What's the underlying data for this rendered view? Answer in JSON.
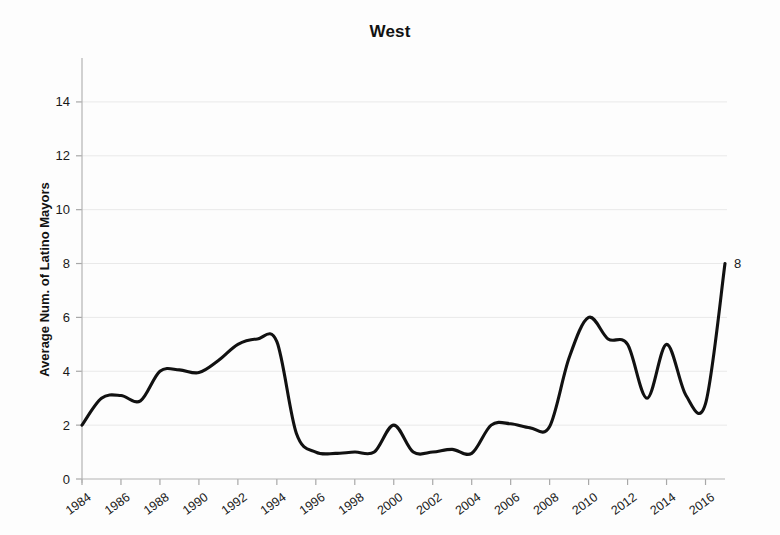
{
  "chart_data": {
    "type": "line",
    "title": "West",
    "xlabel": "",
    "ylabel": "Average Num. of Latino Mayors",
    "xlim": [
      1984,
      2017
    ],
    "ylim": [
      0,
      15
    ],
    "grid": true,
    "legend": "none",
    "line_color": "#111111",
    "background_color": "#fdfdfd",
    "y_ticks": [
      0,
      2,
      4,
      6,
      8,
      10,
      12,
      14
    ],
    "x_ticks": [
      1984,
      1986,
      1988,
      1990,
      1992,
      1994,
      1996,
      1998,
      2000,
      2002,
      2004,
      2006,
      2008,
      2010,
      2012,
      2014,
      2016
    ],
    "x": [
      1984,
      1985,
      1986,
      1987,
      1988,
      1989,
      1990,
      1991,
      1992,
      1993,
      1994,
      1995,
      1996,
      1997,
      1998,
      1999,
      2000,
      2001,
      2002,
      2003,
      2004,
      2005,
      2006,
      2007,
      2008,
      2009,
      2010,
      2011,
      2012,
      2013,
      2014,
      2015,
      2016,
      2017
    ],
    "values": [
      2.0,
      3.0,
      3.1,
      2.9,
      4.0,
      4.05,
      3.95,
      4.4,
      5.0,
      5.2,
      5.1,
      1.7,
      1.0,
      0.95,
      1.0,
      1.0,
      2.0,
      1.0,
      1.0,
      1.1,
      0.95,
      2.0,
      2.05,
      1.9,
      1.95,
      4.5,
      6.0,
      5.2,
      5.0,
      3.0,
      5.0,
      3.1,
      2.8,
      8.0
    ],
    "annotations": [
      {
        "label": "8",
        "x": 2017,
        "y": 8.0
      }
    ]
  }
}
